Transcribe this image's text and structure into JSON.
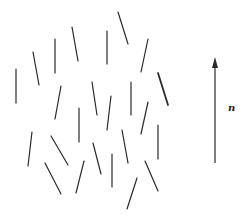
{
  "diagram": {
    "line_color": "#2a2a2a",
    "segments": [
      {
        "x1": 16,
        "y1": 69,
        "x2": 16,
        "y2": 103,
        "w": 1.2
      },
      {
        "x1": 33,
        "y1": 52,
        "x2": 39,
        "y2": 85,
        "w": 1.2
      },
      {
        "x1": 55,
        "y1": 39,
        "x2": 55,
        "y2": 73,
        "w": 1.2
      },
      {
        "x1": 72,
        "y1": 27,
        "x2": 78,
        "y2": 61,
        "w": 1.2
      },
      {
        "x1": 107,
        "y1": 31,
        "x2": 107,
        "y2": 64,
        "w": 1.2
      },
      {
        "x1": 118,
        "y1": 12,
        "x2": 128,
        "y2": 44,
        "w": 1.2
      },
      {
        "x1": 148,
        "y1": 39,
        "x2": 141,
        "y2": 72,
        "w": 1.2
      },
      {
        "x1": 158,
        "y1": 73,
        "x2": 168,
        "y2": 105,
        "w": 1.8
      },
      {
        "x1": 61,
        "y1": 86,
        "x2": 55,
        "y2": 119,
        "w": 1.2
      },
      {
        "x1": 92,
        "y1": 82,
        "x2": 97,
        "y2": 115,
        "w": 1.2
      },
      {
        "x1": 111,
        "y1": 96,
        "x2": 107,
        "y2": 130,
        "w": 1.2
      },
      {
        "x1": 131,
        "y1": 82,
        "x2": 131,
        "y2": 115,
        "w": 1.2
      },
      {
        "x1": 148,
        "y1": 102,
        "x2": 141,
        "y2": 134,
        "w": 1.2
      },
      {
        "x1": 79,
        "y1": 108,
        "x2": 79,
        "y2": 142,
        "w": 1.2
      },
      {
        "x1": 32,
        "y1": 132,
        "x2": 28,
        "y2": 166,
        "w": 1.2
      },
      {
        "x1": 51,
        "y1": 136,
        "x2": 68,
        "y2": 165,
        "w": 1.2
      },
      {
        "x1": 93,
        "y1": 143,
        "x2": 101,
        "y2": 174,
        "w": 1.2
      },
      {
        "x1": 122,
        "y1": 130,
        "x2": 128,
        "y2": 163,
        "w": 1.2
      },
      {
        "x1": 158,
        "y1": 125,
        "x2": 158,
        "y2": 159,
        "w": 1.2
      },
      {
        "x1": 45,
        "y1": 163,
        "x2": 61,
        "y2": 194,
        "w": 1.2
      },
      {
        "x1": 84,
        "y1": 161,
        "x2": 76,
        "y2": 193,
        "w": 1.2
      },
      {
        "x1": 112,
        "y1": 154,
        "x2": 112,
        "y2": 187,
        "w": 1.2
      },
      {
        "x1": 145,
        "y1": 161,
        "x2": 158,
        "y2": 191,
        "w": 1.2
      },
      {
        "x1": 137,
        "y1": 178,
        "x2": 127,
        "y2": 209,
        "w": 1.2
      }
    ],
    "director": {
      "x": 215,
      "y_tail": 163,
      "y_head": 57,
      "label": "n",
      "label_x": 228,
      "label_y": 111
    }
  }
}
